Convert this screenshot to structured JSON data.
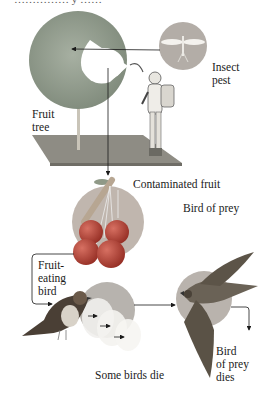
{
  "title_partial": "…………… y ……",
  "labels": {
    "insect_pest": [
      "Insect",
      "pest"
    ],
    "fruit_tree": [
      "Fruit",
      "tree"
    ],
    "contaminated_fruit": "Contaminated fruit",
    "bird_of_prey": "Bird of prey",
    "fruit_eating_bird": [
      "Fruit-",
      "eating",
      "bird"
    ],
    "some_birds_die": "Some birds die",
    "bird_of_prey_dies": [
      "Bird",
      "of prey",
      "dies"
    ]
  },
  "colors": {
    "tree_foliage": "#8f9a8c",
    "ground": "#8e8c84",
    "circle_fill": "#b9b3ad",
    "fruit": "#b84a3c",
    "arrow": "#1a1a1a",
    "falcon": "#5a5246"
  }
}
